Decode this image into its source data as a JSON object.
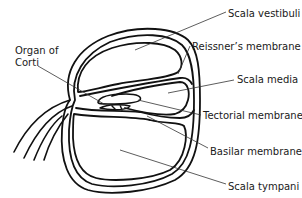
{
  "diagram": {
    "colors": {
      "stroke": "#111111",
      "leader": "#333333",
      "background": "#ffffff"
    },
    "labels": {
      "scala_vestibuli": "Scala vestibuli",
      "reissners_membrane": "Reissner’s membrane",
      "scala_media": "Scala media",
      "tectorial_membrane": "Tectorial membrane",
      "basilar_membrane": "Basilar membrane",
      "scala_tympani": "Scala tympani",
      "organ_of_corti_line1": "Organ of",
      "organ_of_corti_line2": "Corti"
    }
  }
}
